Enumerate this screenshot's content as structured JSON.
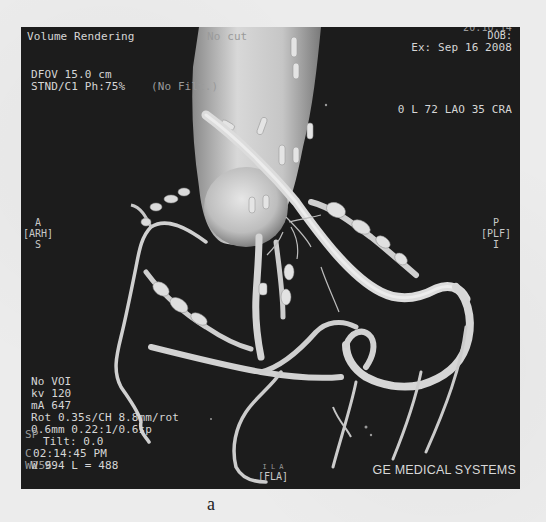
{
  "figure": {
    "panel_label": "a",
    "background_color": "#ececec",
    "viewer_background": "#1c1c1c",
    "vessel_color": "#d9d9d9"
  },
  "viewer": {
    "top_left": {
      "title": "Volume Rendering",
      "title_overlay": "No cut",
      "dfov": "DFOV 15.0 cm",
      "recon": "STND/C1 Ph:75%",
      "filter_overlay": "(No Filt.)"
    },
    "top_right": {
      "partial_line": "20:10:14",
      "dob": "DOB:",
      "exam_date": "Ex: Sep 16 2008",
      "orientation": "0 L 72 LAO 35 CRA"
    },
    "orientation_markers": {
      "left": {
        "top": "A",
        "label": "[ARH]",
        "bottom": "S"
      },
      "right": {
        "top": "P",
        "label": "[PLF]",
        "bottom": "I"
      },
      "bottom": {
        "top": "I L A",
        "label": "[FLA]"
      }
    },
    "bottom_left": {
      "voi": "No VOI",
      "kv": "kv 120",
      "ma": "mA 647",
      "rot": "Rot 0.35s/CH 8.8mm/rot",
      "thickness": "0.6mm 0.22:1/0.6sp",
      "tilt": "Tilt: 0.0",
      "time": "02:14:45 PM",
      "window": "W 994 L = 488",
      "overlay_sp": "SP",
      "overlay_c": "C",
      "overlay_w": "W256"
    },
    "bottom_right": {
      "vendor": "GE MEDICAL SYSTEMS"
    }
  }
}
